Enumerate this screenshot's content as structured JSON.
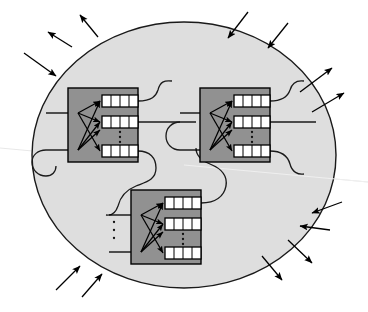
{
  "figure": {
    "canvas": {
      "width": 368,
      "height": 312,
      "background": "#ffffff"
    }
  },
  "colors": {
    "page_background": "#ffffff",
    "boundary_fill": "#dedede",
    "boundary_stroke": "#1a1a1a",
    "module_fill": "#919191",
    "module_stroke": "#000000",
    "register_fill": "#ffffff",
    "register_stroke": "#000000",
    "wire_stroke": "#1a1a1a",
    "arrow_stroke": "#000000",
    "faint_line": "#e8e8e8"
  },
  "boundary": {
    "name": "system-boundary-ellipse",
    "shape": "ellipse",
    "cx": 184,
    "cy": 155,
    "rx": 152,
    "ry": 133,
    "stroke_width": 1.4
  },
  "faint_diagonal": {
    "name": "faint-diagonal-line",
    "x1": 0,
    "y1": 148,
    "x2": 368,
    "y2": 182,
    "stroke_width": 1.2
  },
  "modules": [
    {
      "id": "module-1",
      "label": "module-top-left",
      "x": 68,
      "y": 88,
      "width": 70,
      "height": 74,
      "registers": [
        {
          "id": "m1-reg-top",
          "x": 102,
          "y": 95,
          "width": 36,
          "height": 12,
          "cells": 4
        },
        {
          "id": "m1-reg-mid",
          "x": 102,
          "y": 116,
          "width": 36,
          "height": 12,
          "cells": 4
        },
        {
          "id": "m1-reg-bottom",
          "x": 102,
          "y": 145,
          "width": 36,
          "height": 12,
          "cells": 4
        }
      ],
      "vertical_ellipsis": {
        "x": 120,
        "y_values": [
          132,
          137,
          142
        ]
      },
      "fanin_nodes": [
        {
          "x": 78,
          "y": 113
        },
        {
          "x": 78,
          "y": 150
        }
      ],
      "inner_arrows": [
        {
          "x1": 78,
          "y1": 113,
          "x2": 100,
          "y2": 101
        },
        {
          "x1": 78,
          "y1": 113,
          "x2": 100,
          "y2": 122
        },
        {
          "x1": 78,
          "y1": 113,
          "x2": 100,
          "y2": 151
        },
        {
          "x1": 78,
          "y1": 150,
          "x2": 100,
          "y2": 101
        },
        {
          "x1": 78,
          "y1": 150,
          "x2": 100,
          "y2": 122
        },
        {
          "x1": 78,
          "y1": 150,
          "x2": 100,
          "y2": 130
        }
      ],
      "input_stubs": [
        {
          "x1": 46,
          "y1": 113,
          "x2": 76,
          "y2": 113
        },
        {
          "x1": 46,
          "y1": 150,
          "x2": 76,
          "y2": 150
        }
      ]
    },
    {
      "id": "module-2",
      "label": "module-top-right",
      "x": 200,
      "y": 88,
      "width": 70,
      "height": 74,
      "registers": [
        {
          "id": "m2-reg-top",
          "x": 234,
          "y": 95,
          "width": 36,
          "height": 12,
          "cells": 4
        },
        {
          "id": "m2-reg-mid",
          "x": 234,
          "y": 116,
          "width": 36,
          "height": 12,
          "cells": 4
        },
        {
          "id": "m2-reg-bottom",
          "x": 234,
          "y": 145,
          "width": 36,
          "height": 12,
          "cells": 4
        }
      ],
      "vertical_ellipsis": {
        "x": 252,
        "y_values": [
          132,
          137,
          142
        ]
      },
      "fanin_nodes": [
        {
          "x": 210,
          "y": 113
        },
        {
          "x": 210,
          "y": 150
        }
      ],
      "inner_arrows": [
        {
          "x1": 210,
          "y1": 113,
          "x2": 232,
          "y2": 101
        },
        {
          "x1": 210,
          "y1": 113,
          "x2": 232,
          "y2": 122
        },
        {
          "x1": 210,
          "y1": 113,
          "x2": 232,
          "y2": 151
        },
        {
          "x1": 210,
          "y1": 150,
          "x2": 232,
          "y2": 101
        },
        {
          "x1": 210,
          "y1": 150,
          "x2": 232,
          "y2": 122
        },
        {
          "x1": 210,
          "y1": 150,
          "x2": 232,
          "y2": 130
        }
      ],
      "input_stubs": [
        {
          "x1": 180,
          "y1": 113,
          "x2": 208,
          "y2": 113
        },
        {
          "x1": 180,
          "y1": 150,
          "x2": 208,
          "y2": 150
        }
      ]
    },
    {
      "id": "module-3",
      "label": "module-bottom-center",
      "x": 131,
      "y": 190,
      "width": 70,
      "height": 74,
      "registers": [
        {
          "id": "m3-reg-top",
          "x": 165,
          "y": 197,
          "width": 36,
          "height": 12,
          "cells": 4
        },
        {
          "id": "m3-reg-mid",
          "x": 165,
          "y": 218,
          "width": 36,
          "height": 12,
          "cells": 4
        },
        {
          "id": "m3-reg-bottom",
          "x": 165,
          "y": 247,
          "width": 36,
          "height": 12,
          "cells": 4
        }
      ],
      "vertical_ellipsis": {
        "x": 183,
        "y_values": [
          234,
          239,
          244
        ]
      },
      "outer_ellipsis": {
        "x": 114,
        "y_values": [
          222,
          230,
          238
        ]
      },
      "fanin_nodes": [
        {
          "x": 141,
          "y": 215
        },
        {
          "x": 141,
          "y": 252
        }
      ],
      "inner_arrows": [
        {
          "x1": 141,
          "y1": 215,
          "x2": 163,
          "y2": 203
        },
        {
          "x1": 141,
          "y1": 215,
          "x2": 163,
          "y2": 224
        },
        {
          "x1": 141,
          "y1": 215,
          "x2": 163,
          "y2": 253
        },
        {
          "x1": 141,
          "y1": 252,
          "x2": 163,
          "y2": 203
        },
        {
          "x1": 141,
          "y1": 252,
          "x2": 163,
          "y2": 224
        },
        {
          "x1": 141,
          "y1": 252,
          "x2": 163,
          "y2": 232
        }
      ],
      "input_stubs": [
        {
          "x1": 109,
          "y1": 215,
          "x2": 139,
          "y2": 215
        },
        {
          "x1": 109,
          "y1": 252,
          "x2": 139,
          "y2": 252
        }
      ]
    }
  ],
  "wires": [
    {
      "id": "wire-m1-top-out",
      "description": "from module-1 top register curving up and right, terminating free",
      "path": "M 138 101 C 152 101 156 96 158 90 C 160 82 164 80 172 81"
    },
    {
      "id": "wire-m1-mid-to-m2",
      "description": "straight bus from module-1 middle register to module-2 input",
      "path": "M 138 122 L 196 122"
    },
    {
      "id": "wire-m1-bottom-to-m3",
      "description": "from module-1 bottom register snaking down to module-3 input",
      "path": "M 138 151 C 150 151 156 158 156 168 C 156 180 146 182 136 186 C 126 190 120 198 118 206 C 116 212 112 216 106 215"
    },
    {
      "id": "wire-m1-left-loop",
      "description": "curl entering module-1 second input from the left",
      "path": "M 46 150 C 38 150 32 155 32 162 C 32 170 38 176 46 176 C 52 176 56 172 56 166"
    },
    {
      "id": "wire-m2-top-out",
      "description": "from module-2 top register curving up and right, terminating free",
      "path": "M 270 101 C 282 101 288 96 290 90 C 292 83 297 80 304 81"
    },
    {
      "id": "wire-m2-mid-out",
      "description": "straight bus leaving module-2 middle register to the right",
      "path": "M 270 122 L 316 122"
    },
    {
      "id": "wire-m2-bottom-out",
      "description": "from module-2 bottom register curving down and right",
      "path": "M 270 151 C 282 151 288 157 290 164 C 292 172 298 175 304 174"
    },
    {
      "id": "wire-m2-left-in",
      "description": "curl feeding module-2 lower input from the left",
      "path": "M 180 150 C 172 150 166 144 166 136 C 166 128 172 122 180 122"
    },
    {
      "id": "wire-m3-top-out",
      "description": "from module-3 top register snaking up and right toward module-2 area",
      "path": "M 201 203 C 216 203 224 196 226 186 C 228 174 220 168 210 164 C 200 160 196 154 196 148"
    }
  ],
  "external_arrows": [
    {
      "id": "ext-in-1",
      "direction": "inward",
      "x1": 24,
      "y1": 53,
      "x2": 56,
      "y2": 76
    },
    {
      "id": "ext-out-1",
      "direction": "outward",
      "x1": 72,
      "y1": 47,
      "x2": 48,
      "y2": 32
    },
    {
      "id": "ext-out-2",
      "direction": "outward",
      "x1": 98,
      "y1": 37,
      "x2": 80,
      "y2": 15
    },
    {
      "id": "ext-in-2",
      "direction": "inward",
      "x1": 248,
      "y1": 12,
      "x2": 228,
      "y2": 38
    },
    {
      "id": "ext-in-3",
      "direction": "inward",
      "x1": 288,
      "y1": 23,
      "x2": 268,
      "y2": 48
    },
    {
      "id": "ext-out-3",
      "direction": "outward",
      "x1": 300,
      "y1": 92,
      "x2": 332,
      "y2": 68
    },
    {
      "id": "ext-out-4",
      "direction": "outward",
      "x1": 312,
      "y1": 112,
      "x2": 344,
      "y2": 93
    },
    {
      "id": "ext-in-4",
      "direction": "inward",
      "x1": 342,
      "y1": 202,
      "x2": 312,
      "y2": 213
    },
    {
      "id": "ext-in-5",
      "direction": "inward",
      "x1": 330,
      "y1": 230,
      "x2": 300,
      "y2": 226
    },
    {
      "id": "ext-out-5",
      "direction": "outward",
      "x1": 288,
      "y1": 240,
      "x2": 312,
      "y2": 263
    },
    {
      "id": "ext-out-6",
      "direction": "outward",
      "x1": 262,
      "y1": 256,
      "x2": 282,
      "y2": 280
    },
    {
      "id": "ext-in-6",
      "direction": "inward",
      "x1": 56,
      "y1": 290,
      "x2": 80,
      "y2": 266
    },
    {
      "id": "ext-in-7",
      "direction": "inward",
      "x1": 82,
      "y1": 297,
      "x2": 102,
      "y2": 274
    }
  ],
  "legend_note": "Arrows crossing the ellipse inward are system inputs; arrows pointing outward are system outputs."
}
